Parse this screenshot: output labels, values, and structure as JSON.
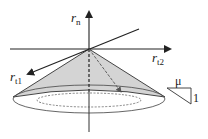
{
  "diagram": {
    "axes": {
      "normal": {
        "label_main": "r",
        "label_sub": "n"
      },
      "tangent1": {
        "label_main": "r",
        "label_sub": "t1"
      },
      "tangent2": {
        "label_main": "r",
        "label_sub": "t2"
      }
    },
    "slope_triangle": {
      "top_label": "μ",
      "side_label": "1"
    },
    "colors": {
      "cone_fill": "#d4d4d4",
      "line": "#222222",
      "ellipse": "#555555"
    }
  }
}
